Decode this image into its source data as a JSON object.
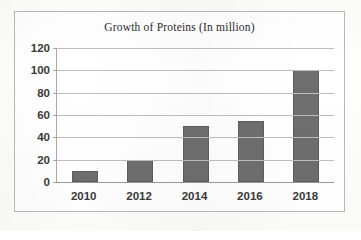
{
  "chart_data": {
    "type": "bar",
    "title": "Growth of Proteins (In million)",
    "xlabel": "",
    "ylabel": "",
    "categories": [
      "2010",
      "2012",
      "2014",
      "2016",
      "2018"
    ],
    "values": [
      10,
      20,
      50,
      55,
      100
    ],
    "series": [
      {
        "name": "Growth of Proteins",
        "values": [
          10,
          20,
          50,
          55,
          100
        ]
      }
    ],
    "ylim": [
      0,
      120
    ],
    "yticks": [
      0,
      20,
      40,
      60,
      80,
      100,
      120
    ],
    "ytick_labels": [
      "0",
      "20",
      "40",
      "60",
      "80",
      "100",
      "120"
    ],
    "grid": true,
    "legend": false,
    "legend_position": "none",
    "bar_color": "#6e6e6e",
    "gridline_color": "#bdbdbd",
    "axis_color": "#9a9a9a",
    "frame_color": "#b9b9b9",
    "background_color": "#ffffff",
    "text_color": "#3a3a3a"
  }
}
